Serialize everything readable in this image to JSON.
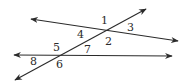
{
  "diagram": {
    "colors": {
      "stroke": "#2a2a2a",
      "background": "#ffffff"
    },
    "lines": [
      {
        "name": "upper-line",
        "x1": 31,
        "y1": 19,
        "x2": 178,
        "y2": 41,
        "arrows": "both"
      },
      {
        "name": "lower-line",
        "x1": 14,
        "y1": 55,
        "x2": 172,
        "y2": 56,
        "arrows": "both"
      },
      {
        "name": "transversal",
        "x1": 15,
        "y1": 80,
        "x2": 146,
        "y2": 9,
        "arrows": "both"
      }
    ],
    "angle_labels": [
      {
        "text": "1",
        "x": 101,
        "y": 24
      },
      {
        "text": "3",
        "x": 127,
        "y": 31
      },
      {
        "text": "4",
        "x": 77,
        "y": 38
      },
      {
        "text": "2",
        "x": 105,
        "y": 45
      },
      {
        "text": "5",
        "x": 53,
        "y": 51
      },
      {
        "text": "7",
        "x": 84,
        "y": 53
      },
      {
        "text": "8",
        "x": 30,
        "y": 65
      },
      {
        "text": "6",
        "x": 56,
        "y": 68
      }
    ]
  }
}
